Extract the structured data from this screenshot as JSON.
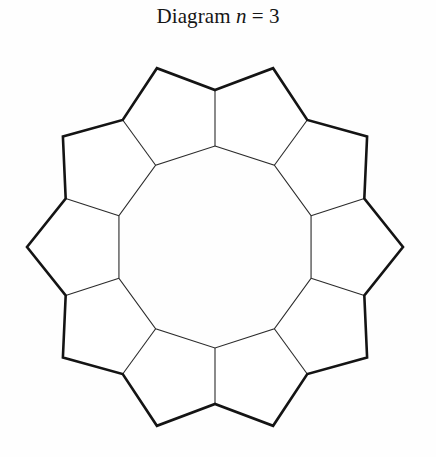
{
  "caption": {
    "prefix": "Diagram",
    "variable": "n",
    "relation": "=",
    "value": "3"
  },
  "figure": {
    "pentagon_count": 10,
    "inner_hole_sides": 10,
    "center_x": 215,
    "center_y": 247,
    "inner_circumradius": 101,
    "outer_convex_radius": 188,
    "outer_concave_radius": 157,
    "rotation_offset_deg": -90,
    "outline_color": "#141414",
    "outline_width": 2.6,
    "divider_color": "#2b2b2b",
    "divider_width": 1.1,
    "fill_color": "#ffffff",
    "background_color": "#fefefe"
  }
}
